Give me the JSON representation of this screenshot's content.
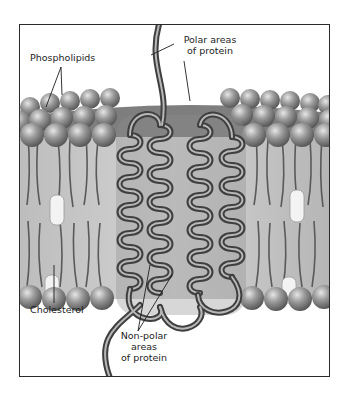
{
  "figure": {
    "labels": {
      "phospholipids": "Phospholipids",
      "polar_line1": "Polar areas",
      "polar_line2": "of protein",
      "cholesterol": "Cholesterol",
      "nonpolar_line1": "Non-polar",
      "nonpolar_line2": "areas",
      "nonpolar_line3": "of protein"
    },
    "colors": {
      "head": "#8a8a8a",
      "head_highlight": "#d8d8d8",
      "tail_region": "#c4c4c4",
      "tail": "#5a5a5a",
      "cholesterol": "#f2f2f2",
      "protein": "#6e6e6e",
      "frame": "#2a2a2a"
    }
  }
}
